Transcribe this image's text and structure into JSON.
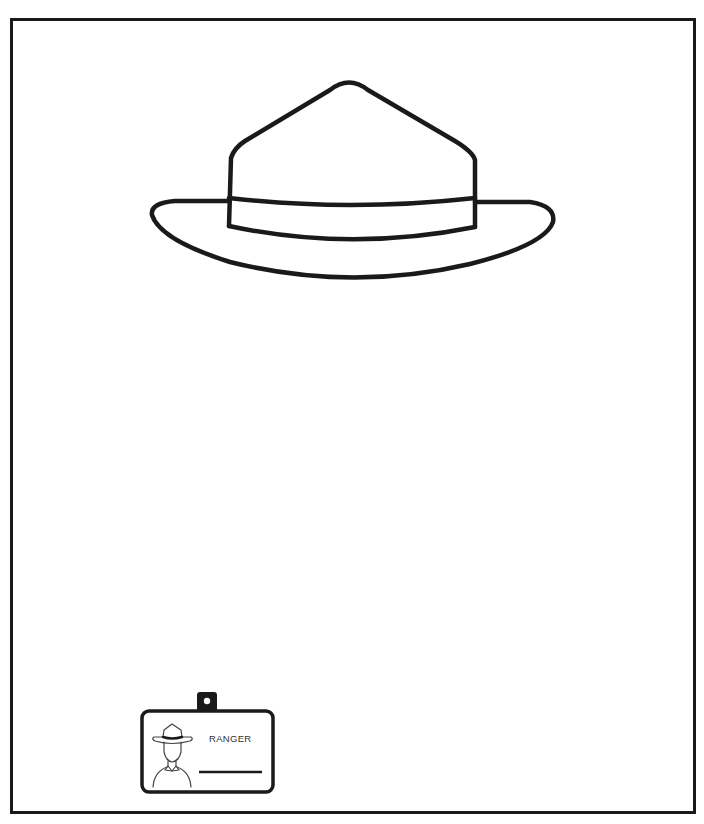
{
  "page": {
    "type": "coloring-page"
  },
  "illustration": {
    "main_icon": "ranger-hat-outline-icon",
    "stroke_color": "#1a1a1a",
    "background": "#ffffff"
  },
  "badge": {
    "icon": "id-badge-icon",
    "portrait_icon": "ranger-portrait-icon",
    "label": "RANGER"
  }
}
